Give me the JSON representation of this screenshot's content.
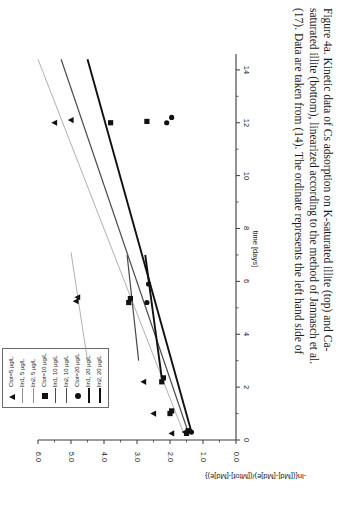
{
  "figure": {
    "label": "Figure 4a.",
    "caption_lines": [
      "Figure 4a. Kinetic data of Cs adsorption on K-saturated illite (top) and Ca-",
      "saturated illite (bottom), linearized according to the method of Jannasch et al.",
      "(17). Data are taken from (14). The ordinate represents the left hand side of"
    ]
  },
  "legend": {
    "items": [
      {
        "label": "Ctot=5 µg/L",
        "key": "triangle"
      },
      {
        "label": "lin1, 5 µg/L",
        "key": "line-thin"
      },
      {
        "label": "lin2, 5 µg/L",
        "key": "line-thin"
      },
      {
        "label": "Ctot=10 µg/L",
        "key": "square"
      },
      {
        "label": "lin1, 10 µg/L",
        "key": "line-medium"
      },
      {
        "label": "lin2, 10 µg/L",
        "key": "line-medium"
      },
      {
        "label": "Ctot=20 µg/L",
        "key": "circle"
      },
      {
        "label": "lin1, 20 µg/L",
        "key": "line-thick"
      },
      {
        "label": "lin2, 20 µg/L",
        "key": "line-thick"
      }
    ]
  },
  "chart_data": {
    "type": "scatter",
    "title": "",
    "xlabel": "time [days]",
    "ylabel": "-ln{([Md]-[Md]e)/([Mtot]-[Md]e)}",
    "xlim": [
      0,
      14.6
    ],
    "ylim": [
      0,
      6.0
    ],
    "xticks": [
      0,
      2,
      4,
      6,
      8,
      10,
      12,
      14
    ],
    "yticks": [
      0.0,
      1.0,
      2.0,
      3.0,
      4.0,
      5.0,
      6.0
    ],
    "xtick_labels": [
      "0",
      "2",
      "4",
      "6",
      "8",
      "10",
      "12",
      "14"
    ],
    "ytick_labels": [
      "0.0",
      "1.0",
      "2.0",
      "3.0",
      "4.0",
      "5.0",
      "6.0"
    ],
    "grid": false,
    "legend_position": "top-right",
    "series": [
      {
        "name": "Ctot=5 µg/L",
        "marker": "triangle",
        "points": [
          {
            "x": 0.25,
            "y": 1.95
          },
          {
            "x": 0.3,
            "y": 1.55
          },
          {
            "x": 1.0,
            "y": 2.5
          },
          {
            "x": 2.2,
            "y": 2.8
          },
          {
            "x": 5.25,
            "y": 4.85
          },
          {
            "x": 5.4,
            "y": 4.8
          },
          {
            "x": 12.0,
            "y": 5.5
          },
          {
            "x": 12.1,
            "y": 5.0
          }
        ]
      },
      {
        "name": "Ctot=10 µg/L",
        "marker": "square",
        "points": [
          {
            "x": 0.25,
            "y": 1.5
          },
          {
            "x": 0.35,
            "y": 1.45
          },
          {
            "x": 1.0,
            "y": 2.0
          },
          {
            "x": 1.1,
            "y": 1.95
          },
          {
            "x": 2.2,
            "y": 2.25
          },
          {
            "x": 2.35,
            "y": 2.2
          },
          {
            "x": 5.2,
            "y": 3.25
          },
          {
            "x": 5.35,
            "y": 3.2
          },
          {
            "x": 12.0,
            "y": 3.8
          },
          {
            "x": 12.05,
            "y": 2.7
          }
        ]
      },
      {
        "name": "Ctot=20 µg/L",
        "marker": "circle",
        "points": [
          {
            "x": 0.3,
            "y": 1.35
          },
          {
            "x": 5.2,
            "y": 2.7
          },
          {
            "x": 5.9,
            "y": 2.65
          },
          {
            "x": 12.0,
            "y": 2.1
          },
          {
            "x": 12.2,
            "y": 1.95
          }
        ]
      }
    ],
    "fit_lines": [
      {
        "name": "lin1, 5 µg/L",
        "style": "thin",
        "x0": 0.3,
        "y0": 1.6,
        "x1": 14.4,
        "y1": 6.0
      },
      {
        "name": "lin2, 5 µg/L",
        "style": "thin",
        "x0": 3.0,
        "y0": 4.5,
        "x1": 7.1,
        "y1": 5.0
      },
      {
        "name": "lin1, 10 µg/L",
        "style": "medium",
        "x0": 0.3,
        "y0": 1.45,
        "x1": 14.4,
        "y1": 5.3
      },
      {
        "name": "lin2, 10 µg/L",
        "style": "medium",
        "x0": 3.0,
        "y0": 2.95,
        "x1": 7.0,
        "y1": 3.3
      },
      {
        "name": "lin1, 20 µg/L",
        "style": "thick",
        "x0": 0.3,
        "y0": 1.35,
        "x1": 14.4,
        "y1": 4.5
      },
      {
        "name": "lin2, 20 µg/L",
        "style": "thick",
        "x0": 2.35,
        "y0": 2.25,
        "x1": 7.0,
        "y1": 2.75
      }
    ]
  }
}
